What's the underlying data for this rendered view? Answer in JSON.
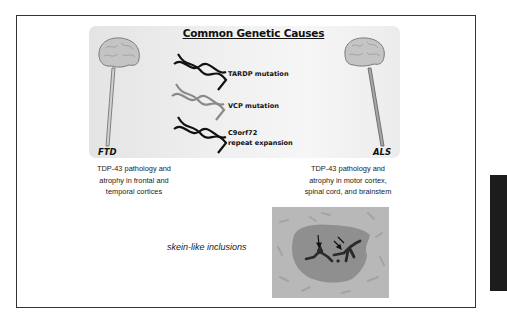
{
  "figure": {
    "title": "Common Genetic Causes",
    "genes": [
      {
        "label_lines": [
          "TARDP mutation"
        ],
        "strand_color": "#111111"
      },
      {
        "label_lines": [
          "VCP mutation"
        ],
        "strand_color": "#8a8a8a"
      },
      {
        "label_lines": [
          "C9orf72",
          "repeat expansion"
        ],
        "strand_color": "#111111"
      }
    ],
    "diseases": {
      "left": {
        "name": "FTD",
        "caption_lines": [
          "TDP-43 pathology and",
          "atrophy in frontal and",
          "temporal cortices"
        ]
      },
      "right": {
        "name": "ALS",
        "caption_lines": [
          "TDP-43 pathology and",
          "atrophy in motor cortex,",
          "spinal cord, and brainstem"
        ]
      }
    },
    "inclusions_label": "skein-like inclusions",
    "icons": [
      "brain-icon",
      "spinal-cord-icon",
      "dna-helix-icon",
      "arrow-icon"
    ],
    "colors": {
      "panel": "#ececec",
      "frame": "#333333",
      "micro_bg": "#b8b8b8",
      "cell": "#8f8f8f",
      "inclusion": "#2a2a2a"
    }
  }
}
